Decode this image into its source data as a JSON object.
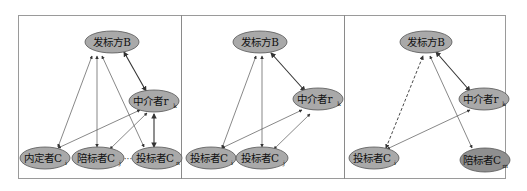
{
  "panels": [
    {
      "id": "panel-1",
      "nodes": {
        "issuer": {
          "label": "发标方B"
        },
        "broker": {
          "label": "中介者r",
          "sub": "k"
        },
        "insider": {
          "label": "内定者C",
          "sub": "i"
        },
        "accompany": {
          "label": "陪标者C",
          "sub": "j"
        },
        "bidder": {
          "label": "投标者C",
          "sub": "n"
        }
      },
      "ellipsis": "···"
    },
    {
      "id": "panel-2",
      "nodes": {
        "issuer": {
          "label": "发标方B"
        },
        "broker": {
          "label": "中介者r",
          "sub": "k"
        },
        "bidder1": {
          "label": "投标者C",
          "sub": "i"
        },
        "bidder2": {
          "label": "投标者C",
          "sub": "j"
        }
      }
    },
    {
      "id": "panel-3",
      "nodes": {
        "issuer": {
          "label": "发标方B"
        },
        "broker": {
          "label": "中介者r",
          "sub": "k"
        },
        "bidder": {
          "label": "投标者C",
          "sub": "i"
        },
        "accompany": {
          "label": "陪标者C",
          "sub": "m"
        }
      }
    }
  ],
  "colors": {
    "node_fill": "#a9a9a9",
    "node_fill_dark": "#8f8f8f",
    "edge": "#555555",
    "frame": "#9a9a9a"
  }
}
